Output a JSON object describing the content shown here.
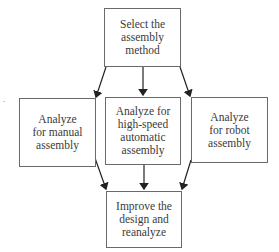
{
  "diagram": {
    "type": "flowchart",
    "nodes": [
      {
        "id": "select",
        "label": "Select the\nassembly\nmethod"
      },
      {
        "id": "manual",
        "label": "Analyze\nfor manual\nassembly"
      },
      {
        "id": "highspeed",
        "label": "Analyze for\nhigh-speed\nautomatic\nassembly"
      },
      {
        "id": "robot",
        "label": "Analyze\nfor robot\nassembly"
      },
      {
        "id": "improve",
        "label": "Improve the\ndesign and\nreanalyze"
      }
    ],
    "edges": [
      {
        "from": "select",
        "to": "manual"
      },
      {
        "from": "select",
        "to": "highspeed"
      },
      {
        "from": "select",
        "to": "robot"
      },
      {
        "from": "manual",
        "to": "improve"
      },
      {
        "from": "highspeed",
        "to": "improve"
      },
      {
        "from": "robot",
        "to": "improve"
      }
    ],
    "stray_mark": "-"
  }
}
